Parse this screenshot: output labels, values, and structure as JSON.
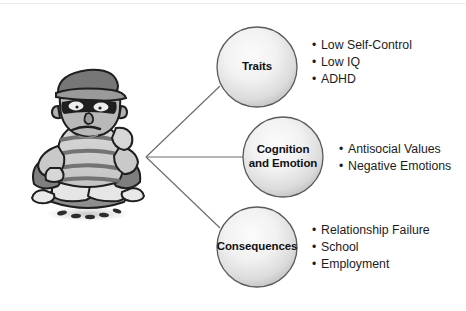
{
  "diagram": {
    "background_color": "#ffffff",
    "line_color": "#6e6e6e",
    "text_color": "#1c1c1c",
    "node_fill_center": "#f6f6f6",
    "node_fill_edge": "#b0b0b0",
    "node_stroke": "#5a5a5a",
    "nodes": [
      {
        "id": "traits",
        "label": "Traits",
        "cx": 257,
        "cy": 67,
        "r": 40,
        "bullets": [
          "Low Self-Control",
          "Low IQ",
          "ADHD"
        ]
      },
      {
        "id": "cognition-and-emotion",
        "label": "Cognition\nand Emotion",
        "cx": 283,
        "cy": 157,
        "r": 40,
        "bullets": [
          "Antisocial Values",
          "Negative Emotions"
        ]
      },
      {
        "id": "consequences",
        "label": "Consequences",
        "cx": 257,
        "cy": 247,
        "r": 40,
        "bullets": [
          "Relationship Failure",
          "School",
          "Employment"
        ]
      }
    ],
    "connector": {
      "origin_x": 146,
      "origin_y": 157,
      "targets": [
        {
          "x": 219,
          "y": 85
        },
        {
          "x": 243,
          "y": 157
        },
        {
          "x": 219,
          "y": 229
        }
      ]
    },
    "illustration": {
      "name": "cartoon-burglar-character",
      "description": "Seated cartoon burglar wearing a flat cap, black eye mask and striped shirt, resting chin on hand",
      "bullet_glyph": "•"
    }
  }
}
